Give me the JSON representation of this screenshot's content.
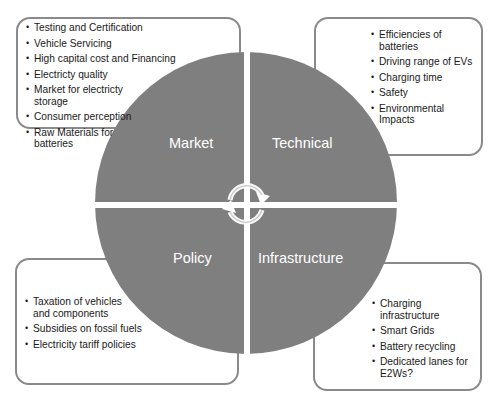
{
  "diagram": {
    "title": "",
    "quadrants": [
      {
        "id": "market",
        "label": "Market",
        "items": [
          "Testing and Certification",
          "Vehicle Servicing",
          "High capital cost and Financing",
          "Electricty quality",
          "Market for electricty storage",
          "Consumer perception",
          "Raw Materials for batteries"
        ]
      },
      {
        "id": "technical",
        "label": "Technical",
        "items": [
          "Efficiencies of batteries",
          "Driving range of EVs",
          "Charging time",
          "Safety",
          "Environmental Impacts"
        ]
      },
      {
        "id": "policy",
        "label": "Policy",
        "items": [
          "Taxation of vehicles and components",
          "Subsidies on fossil fuels",
          "Electricity tariff policies"
        ]
      },
      {
        "id": "infrastructure",
        "label": "Infrastructure",
        "items": [
          "Charging infrastructure",
          "Smart Grids",
          "Battery recycling",
          "Dedicated lanes for E2Ws?"
        ]
      }
    ],
    "center_icon": "cycle-arrows-icon",
    "colors": {
      "quadrant_fill": "#7f7f7f",
      "box_border": "#8a8a8a",
      "label_text": "#ffffff"
    }
  }
}
